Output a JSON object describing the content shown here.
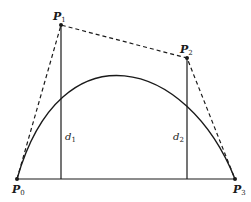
{
  "diagram": {
    "type": "cubic-bezier-construction",
    "colors": {
      "stroke": "#1a1a1a",
      "background": "#ffffff"
    },
    "points": [
      {
        "id": "P0",
        "label": "P",
        "subscript": "0",
        "x": 17,
        "y": 179,
        "label_x": 12,
        "label_y": 193
      },
      {
        "id": "P1",
        "label": "P",
        "subscript": "1",
        "x": 61,
        "y": 25,
        "label_x": 53,
        "label_y": 20
      },
      {
        "id": "P2",
        "label": "P",
        "subscript": "2",
        "x": 187,
        "y": 58,
        "label_x": 180,
        "label_y": 53
      },
      {
        "id": "P3",
        "label": "P",
        "subscript": "3",
        "x": 235,
        "y": 179,
        "label_x": 233,
        "label_y": 193
      }
    ],
    "distances": [
      {
        "id": "d1",
        "label": "d",
        "subscript": "1",
        "x": 61,
        "y_top": 25,
        "y_bottom": 179,
        "label_x": 65,
        "label_y": 140
      },
      {
        "id": "d2",
        "label": "d",
        "subscript": "2",
        "x": 187,
        "y_top": 58,
        "y_bottom": 179,
        "label_x": 173,
        "label_y": 140
      }
    ],
    "control_polygon": "dashed P0-P1-P2-P3",
    "baseline": "solid P0-P3",
    "curve": "solid cubic Bezier P0..P3"
  }
}
